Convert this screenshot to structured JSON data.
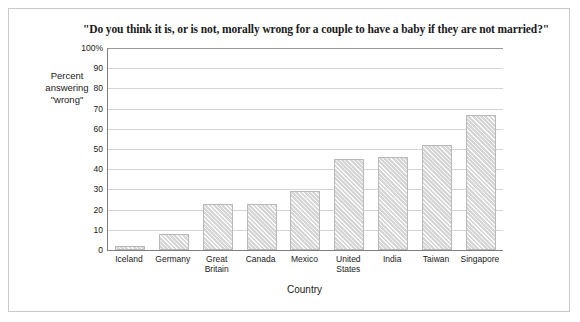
{
  "chart_data": {
    "type": "bar",
    "title": "\"Do you think it is, or is not, morally wrong for a couple to have a baby if they are not married?\"",
    "xlabel": "Country",
    "ylabel": "Percent answering \"wrong\"",
    "ylim": [
      0,
      100
    ],
    "ytick_labels": [
      "100%",
      "90",
      "80",
      "70",
      "60",
      "50",
      "40",
      "30",
      "20",
      "10",
      "0"
    ],
    "ytick_values": [
      100,
      90,
      80,
      70,
      60,
      50,
      40,
      30,
      20,
      10,
      0
    ],
    "grid": "horizontal",
    "legend": "none",
    "categories": [
      "Iceland",
      "Germany",
      "Great\nBritain",
      "Canada",
      "Mexico",
      "United\nStates",
      "India",
      "Taiwan",
      "Singapore"
    ],
    "category_lines": [
      [
        "Iceland"
      ],
      [
        "Germany"
      ],
      [
        "Great",
        "Britain"
      ],
      [
        "Canada"
      ],
      [
        "Mexico"
      ],
      [
        "United",
        "States"
      ],
      [
        "India"
      ],
      [
        "Taiwan"
      ],
      [
        "Singapore"
      ]
    ],
    "values": [
      2,
      8,
      23,
      23,
      29,
      45,
      46,
      52,
      67
    ],
    "bar_color": "#d6d6d6",
    "bar_border_color": "#b9b9b9"
  },
  "yaxis_title_lines": [
    "Percent",
    "answering",
    "\"wrong\""
  ]
}
